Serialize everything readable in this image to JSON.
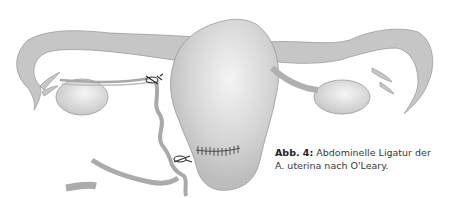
{
  "figure": {
    "label": "Abb. 4:",
    "caption_line1": "Abdominelle Ligatur der",
    "caption_line2": "A. uterina nach O'Leary.",
    "colors": {
      "tissue": "#c9c9c9",
      "tissue_outline": "#9a9a9a",
      "highlight": "#f2f2f2",
      "suture": "#2a2a2a",
      "vessel": "#b5b5b5"
    }
  }
}
